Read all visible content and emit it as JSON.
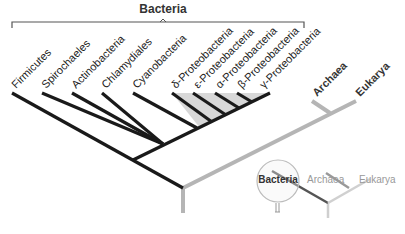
{
  "header": {
    "title": "Bacteria"
  },
  "colors": {
    "bacteria_branch": "#1a1a1a",
    "other_branch": "#b5b5b5",
    "proteo_shade": "#d8d8d8",
    "bracket": "#555555",
    "inset_bacteria": "#555555",
    "inset_archaea": "#999999",
    "inset_eukarya": "#c8c8c8"
  },
  "taxa": [
    {
      "label": "Firmicutes"
    },
    {
      "label": "Spirochaeles"
    },
    {
      "label": "Actinobacteria"
    },
    {
      "label": "Chlamydiales"
    },
    {
      "label": "Cyanobacteria"
    },
    {
      "label": "δ-Proteobacteria"
    },
    {
      "label": "ε-Proteobacteria"
    },
    {
      "label": "α-Proteobacteria"
    },
    {
      "label": "β-Proteobacteria"
    },
    {
      "label": "γ-Proteobacteria"
    }
  ],
  "domains": {
    "archaea": "Archaea",
    "eukarya": "Eukarya"
  },
  "inset": {
    "bacteria": "Bacteria",
    "archaea": "Archaea",
    "eukarya": "Eukarya"
  }
}
